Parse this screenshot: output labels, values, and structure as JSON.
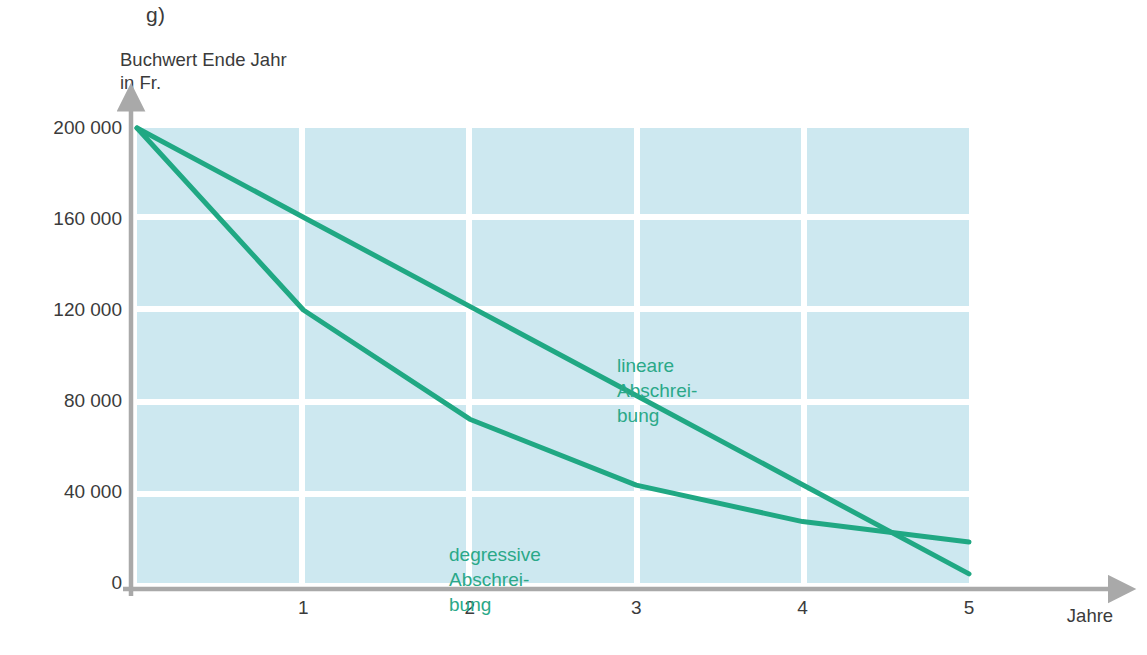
{
  "figure": {
    "panel_letter": "g)",
    "background_color": "#ffffff"
  },
  "axes": {
    "y_title": "Buchwert Ende Jahr\nin Fr.",
    "x_title": "Jahre",
    "axis_color": "#a8a8a8",
    "tick_label_color": "#3b3b3b"
  },
  "annotations": {
    "linear": "lineare\nAbschrei-\nbung",
    "degressive": "degressive\nAbschrei-\nbung",
    "color": "#2aa888"
  },
  "chart_data": {
    "type": "line",
    "title": "g)",
    "xlabel": "Jahre",
    "ylabel": "Buchwert Ende Jahr in Fr.",
    "xlim": [
      0,
      5
    ],
    "ylim": [
      0,
      200000
    ],
    "x": [
      0,
      1,
      2,
      3,
      4,
      5
    ],
    "x_tick_labels": [
      "0",
      "1",
      "2",
      "3",
      "4",
      "5"
    ],
    "y_tick_values": [
      0,
      40000,
      80000,
      120000,
      160000,
      200000
    ],
    "y_tick_labels": [
      "0",
      "40 000",
      "80 000",
      "120 000",
      "160 000",
      "200 000"
    ],
    "grid": true,
    "grid_style": "blocked cells, light blue fill with white gutters",
    "grid_cell_color": "#cde8f0",
    "grid_gutter_color": "#ffffff",
    "legend": "inline annotations",
    "series": [
      {
        "name": "lineare Abschreibung",
        "color": "#20a883",
        "values": [
          200000,
          160800,
          121600,
          82400,
          43200,
          4000
        ]
      },
      {
        "name": "degressive Abschreibung",
        "color": "#20a883",
        "values": [
          200000,
          120000,
          72000,
          43000,
          27000,
          18000
        ]
      }
    ]
  }
}
